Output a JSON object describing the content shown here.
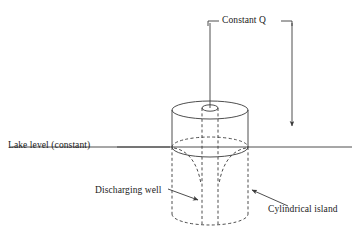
{
  "figure": {
    "domain": "hydrogeology-schematic",
    "background_color": "#ffffff",
    "line_color": "#3a3a3a",
    "text_color": "#1a1a1a"
  },
  "labels": {
    "lake_level": "Lake level (constant)",
    "constant_q": "Constant Q",
    "discharging_well": "Discharging well",
    "cylindrical_island": "Cylindrical island"
  },
  "geometry": {
    "lake_level_y": 147,
    "lake_line_x_start": 10,
    "lake_line_x_end": 352,
    "cylinder_left_x": 172,
    "cylinder_right_x": 248,
    "cylinder_top_y": 110,
    "cylinder_bottom_y": 222,
    "cylinder_rx": 38,
    "cylinder_ry": 9,
    "well_left_x": 202,
    "well_right_x": 218,
    "well_mouth_y": 108,
    "well_rx": 8,
    "well_ry": 3
  },
  "annotations": {
    "leader_constant_q_left_x": 208,
    "leader_constant_q_right_x": 292,
    "leader_top_y": 21,
    "inflow_pipe_x": 210,
    "inflow_pipe_top_y": 21,
    "inflow_pipe_bottom_y": 108,
    "arrow_right_x": 292,
    "arrow_right_top_y": 21,
    "arrow_right_bottom_y": 128,
    "arrow_well_from": [
      168,
      188
    ],
    "arrow_well_to": [
      200,
      200
    ],
    "arrow_island_from": [
      288,
      206
    ],
    "arrow_island_to": [
      250,
      188
    ]
  },
  "elements": {
    "cylinder_top_ellipse": "solid",
    "cylinder_side_above_water": "solid",
    "waterline_ellipse_back": "dashed",
    "waterline_ellipse_front": "solid",
    "cylinder_side_below_water": "dashed",
    "cylinder_bottom_ellipse": "dashed",
    "well_casing": "dashed",
    "drawdown_cone": "dashed"
  }
}
